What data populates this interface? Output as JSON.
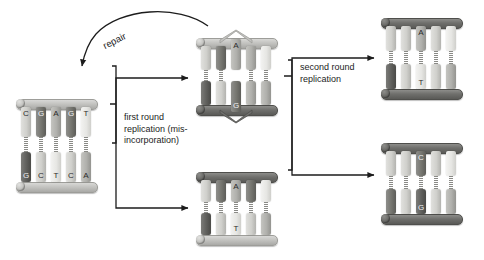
{
  "figure": {
    "background_color": "#ffffff",
    "stroke_color": "#1c1c1c",
    "label_text_color": "#1c1c1c"
  },
  "labels": {
    "repair": "repair",
    "first_round": "first round\nreplication (mis-\nincorporation)",
    "second_round": "second round\nreplication"
  },
  "palette": {
    "backbone_light": "#c3c3c0",
    "backbone_dark": "#6f6f6c",
    "base_verylight": "#e6e6e3",
    "base_light": "#d0d0cc",
    "base_mid": "#b0b0ac",
    "base_dark": "#75756f",
    "base_verydark": "#5f5f5c",
    "hbond": "#8a8a86"
  },
  "duplexes": [
    {
      "id": "parent-duplex",
      "name": "parent-duplex",
      "position": {
        "x": 16,
        "y": 99,
        "w": 84,
        "h": 92
      },
      "top_backbone": "light",
      "bottom_backbone": "light",
      "bulge": "none",
      "top_strand": [
        {
          "base": "C",
          "shade": "light"
        },
        {
          "base": "G",
          "shade": "dark"
        },
        {
          "base": "A",
          "shade": "mid"
        },
        {
          "base": "G",
          "shade": "dark"
        },
        {
          "base": "T",
          "shade": "verylight"
        }
      ],
      "bottom_strand": [
        {
          "base": "G",
          "shade": "verydark"
        },
        {
          "base": "C",
          "shade": "light"
        },
        {
          "base": "T",
          "shade": "verylight"
        },
        {
          "base": "C",
          "shade": "light"
        },
        {
          "base": "A",
          "shade": "mid"
        }
      ]
    },
    {
      "id": "mismatch-duplex",
      "name": "mismatched-duplex-with-bulge",
      "position": {
        "x": 196,
        "y": 30,
        "w": 84,
        "h": 92
      },
      "top_backbone": "light",
      "bottom_backbone": "dark",
      "bulge": "both",
      "top_strand": [
        {
          "base": "",
          "shade": "light"
        },
        {
          "base": "",
          "shade": "dark"
        },
        {
          "base": "A",
          "shade": "mid"
        },
        {
          "base": "",
          "shade": "mid"
        },
        {
          "base": "",
          "shade": "verylight"
        }
      ],
      "bottom_strand": [
        {
          "base": "",
          "shade": "verydark"
        },
        {
          "base": "",
          "shade": "light"
        },
        {
          "base": "G",
          "shade": "dark"
        },
        {
          "base": "",
          "shade": "mid"
        },
        {
          "base": "",
          "shade": "mid"
        }
      ]
    },
    {
      "id": "at-duplex-middle",
      "name": "a-t-duplex-middle-bottom",
      "position": {
        "x": 196,
        "y": 172,
        "w": 84,
        "h": 72
      },
      "top_backbone": "dark",
      "bottom_backbone": "light",
      "bulge": "none",
      "top_strand": [
        {
          "base": "",
          "shade": "light"
        },
        {
          "base": "",
          "shade": "dark"
        },
        {
          "base": "A",
          "shade": "mid"
        },
        {
          "base": "",
          "shade": "dark"
        },
        {
          "base": "",
          "shade": "verylight"
        }
      ],
      "bottom_strand": [
        {
          "base": "",
          "shade": "verydark"
        },
        {
          "base": "",
          "shade": "light"
        },
        {
          "base": "T",
          "shade": "verylight"
        },
        {
          "base": "",
          "shade": "light"
        },
        {
          "base": "",
          "shade": "mid"
        }
      ]
    },
    {
      "id": "at-duplex-right",
      "name": "a-t-duplex-top-right",
      "position": {
        "x": 381,
        "y": 18,
        "w": 84,
        "h": 80
      },
      "top_backbone": "dark",
      "bottom_backbone": "dark",
      "bulge": "none",
      "top_strand": [
        {
          "base": "",
          "shade": "light"
        },
        {
          "base": "",
          "shade": "light"
        },
        {
          "base": "A",
          "shade": "mid"
        },
        {
          "base": "",
          "shade": "light"
        },
        {
          "base": "",
          "shade": "verylight"
        }
      ],
      "bottom_strand": [
        {
          "base": "",
          "shade": "verydark"
        },
        {
          "base": "",
          "shade": "light"
        },
        {
          "base": "T",
          "shade": "verylight"
        },
        {
          "base": "",
          "shade": "light"
        },
        {
          "base": "",
          "shade": "mid"
        }
      ]
    },
    {
      "id": "cg-duplex-right",
      "name": "c-g-duplex-bottom-right",
      "position": {
        "x": 381,
        "y": 143,
        "w": 84,
        "h": 80
      },
      "top_backbone": "dark",
      "bottom_backbone": "dark",
      "bulge": "none",
      "top_strand": [
        {
          "base": "",
          "shade": "light"
        },
        {
          "base": "",
          "shade": "light"
        },
        {
          "base": "C",
          "shade": "dark"
        },
        {
          "base": "",
          "shade": "light"
        },
        {
          "base": "",
          "shade": "verylight"
        }
      ],
      "bottom_strand": [
        {
          "base": "",
          "shade": "dark"
        },
        {
          "base": "",
          "shade": "light"
        },
        {
          "base": "G",
          "shade": "verydark"
        },
        {
          "base": "",
          "shade": "light"
        },
        {
          "base": "",
          "shade": "mid"
        }
      ]
    }
  ],
  "arrows": [
    {
      "name": "repair-arrow",
      "kind": "curved",
      "label": "repair",
      "from": "mismatch-duplex",
      "to": "parent-duplex"
    },
    {
      "name": "first-round-arrow-upper",
      "kind": "elbow",
      "label": "first round replication (mis-incorporation)",
      "from": "parent-duplex",
      "to": "mismatch-duplex"
    },
    {
      "name": "first-round-arrow-lower",
      "kind": "elbow",
      "label": "first round replication (mis-incorporation)",
      "from": "parent-duplex",
      "to": "at-duplex-middle"
    },
    {
      "name": "second-round-arrow-upper",
      "kind": "elbow",
      "label": "second round replication",
      "from": "mismatch-duplex",
      "to": "at-duplex-right"
    },
    {
      "name": "second-round-arrow-lower",
      "kind": "elbow",
      "label": "second round replication",
      "from": "mismatch-duplex",
      "to": "cg-duplex-right"
    }
  ]
}
